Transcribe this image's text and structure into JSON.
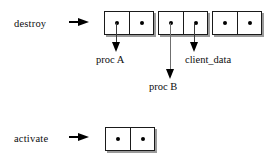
{
  "diagram": {
    "background_color": "#ffffff",
    "ink_color": "#000000",
    "shadow_color": "#9a9a9a",
    "rows": [
      {
        "id": "destroy",
        "label": "destroy",
        "arrow_icon": "right-arrow-icon"
      },
      {
        "id": "activate",
        "label": "activate",
        "arrow_icon": "right-arrow-icon"
      }
    ],
    "destroy_cells": [
      {
        "id": "pair-1",
        "cells": [
          {
            "id": "pair-1-car",
            "content": "dot"
          },
          {
            "id": "pair-1-cdr",
            "content": "dot"
          }
        ]
      },
      {
        "id": "pair-2",
        "cells": [
          {
            "id": "pair-2-car",
            "content": "dot"
          },
          {
            "id": "pair-2-cdr",
            "content": "dot"
          }
        ]
      },
      {
        "id": "pair-3",
        "cells": [
          {
            "id": "pair-3-car",
            "content": "dot"
          },
          {
            "id": "pair-3-cdr",
            "content": "dot"
          }
        ]
      }
    ],
    "activate_cells": [
      {
        "id": "pair-4",
        "cells": [
          {
            "id": "pair-4-car",
            "content": "dot"
          },
          {
            "id": "pair-4-cdr",
            "content": "dot"
          }
        ]
      }
    ],
    "annotations": [
      {
        "id": "proc-a",
        "text": "proc A",
        "source": "pair-1-car"
      },
      {
        "id": "proc-b",
        "text": "proc B",
        "source": "pair-2-car"
      },
      {
        "id": "client-data",
        "text": "client_data",
        "source": "pair-2-cdr"
      }
    ]
  }
}
